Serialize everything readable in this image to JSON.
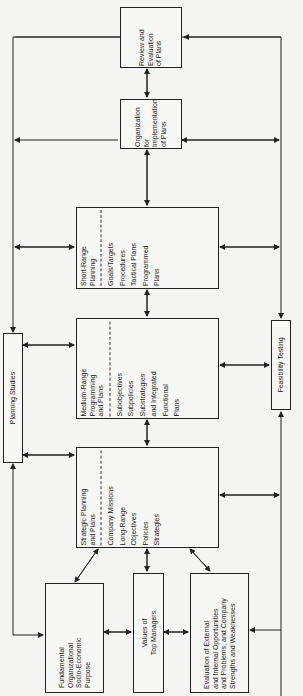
{
  "diagram": {
    "orientation": "rotated-90-ccw",
    "line_color": "#222222",
    "nodes": {
      "planning_studies": {
        "label": "Planning Studies"
      },
      "feasibility_testing": {
        "label": "Feasibility Testing"
      },
      "fundamental_purpose": {
        "lines": [
          "Fundamental",
          "Organizational",
          "Socio-Economic",
          "Purpose"
        ]
      },
      "values_top_managers": {
        "lines": [
          "Values of",
          "Top Managers"
        ]
      },
      "evaluation": {
        "lines": [
          "Evaluation of External",
          "and Internal Opportunities",
          "and Problems, and Company",
          "Strengths and Weaknesses"
        ]
      },
      "strategic": {
        "header": [
          "Strategic Planning",
          "and Plans"
        ],
        "items": [
          "Company Missions",
          "Long-Range",
          "Objectives",
          "Policies",
          "Strategies"
        ]
      },
      "medium_range": {
        "header": [
          "Medium-Range",
          "Programming",
          "and Plans"
        ],
        "items": [
          "Subobjectives",
          "Subpolicies",
          "Substrategies",
          "and Integrated",
          "Functional",
          "Plans"
        ]
      },
      "short_range": {
        "header": [
          "Short-Range",
          "Planning"
        ],
        "items": [
          "Goals/Targets",
          "Procedures",
          "Tactical Plans",
          "Programmed",
          "Plans"
        ]
      },
      "organization": {
        "lines": [
          "Organization",
          "for",
          "Implementation",
          "of Plans"
        ]
      },
      "review": {
        "lines": [
          "Review and",
          "Evaluation",
          "of Plans"
        ]
      }
    }
  }
}
